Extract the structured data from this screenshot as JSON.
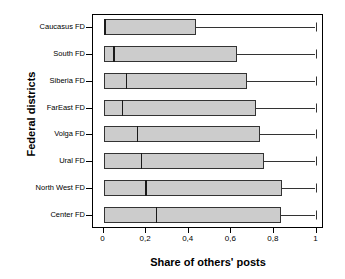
{
  "chart_data": {
    "type": "box",
    "title": "",
    "xlabel": "Share of others' posts",
    "ylabel": "Federal districts",
    "xlim": [
      0,
      1.05
    ],
    "grid": false,
    "legend": null,
    "x_tick_labels": [
      "0",
      "0,2",
      "0,4",
      "0,6",
      "0,8",
      "1"
    ],
    "x_tick_values": [
      0,
      0.2,
      0.4,
      0.6,
      0.8,
      1
    ],
    "categories": [
      "Caucasus FD",
      "South FD",
      "Siberia FD",
      "FarEast FD",
      "Volga FD",
      "Ural FD",
      "North West FD",
      "Center FD"
    ],
    "boxes": [
      {
        "category": "Caucasus FD",
        "whisker_low": 0.005,
        "q1": 0.005,
        "median": 0.008,
        "q3": 0.44,
        "whisker_high": 1.0
      },
      {
        "category": "South FD",
        "whisker_low": 0.005,
        "q1": 0.005,
        "median": 0.05,
        "q3": 0.63,
        "whisker_high": 1.0
      },
      {
        "category": "Siberia FD",
        "whisker_low": 0.005,
        "q1": 0.005,
        "median": 0.11,
        "q3": 0.68,
        "whisker_high": 1.0
      },
      {
        "category": "FarEast FD",
        "whisker_low": 0.005,
        "q1": 0.005,
        "median": 0.09,
        "q3": 0.72,
        "whisker_high": 1.0
      },
      {
        "category": "Volga FD",
        "whisker_low": 0.005,
        "q1": 0.005,
        "median": 0.16,
        "q3": 0.74,
        "whisker_high": 1.0
      },
      {
        "category": "Ural FD",
        "whisker_low": 0.005,
        "q1": 0.005,
        "median": 0.18,
        "q3": 0.76,
        "whisker_high": 1.0
      },
      {
        "category": "North West FD",
        "whisker_low": 0.005,
        "q1": 0.005,
        "median": 0.2,
        "q3": 0.845,
        "whisker_high": 1.0
      },
      {
        "category": "Center FD",
        "whisker_low": 0.005,
        "q1": 0.005,
        "median": 0.25,
        "q3": 0.84,
        "whisker_high": 1.0
      }
    ],
    "colors": {
      "box_fill": "#cccccc",
      "box_stroke": "#333333",
      "median_stroke": "#1a1a1a",
      "axis": "#000000",
      "background": "#ffffff"
    }
  }
}
